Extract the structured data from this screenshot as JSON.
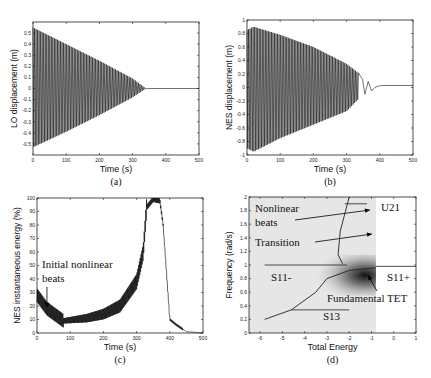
{
  "chart_data": [
    {
      "panel": "a",
      "type": "line",
      "caption": "(a)",
      "xlabel": "Time (s)",
      "ylabel": "LO displacement (m)",
      "xlim": [
        0,
        500
      ],
      "ylim": [
        -0.6,
        0.6
      ],
      "xticks": [
        "0",
        "100",
        "200",
        "300",
        "400",
        "500"
      ],
      "yticks": [
        "-0.5",
        "-0.4",
        "-0.3",
        "-0.2",
        "-0.1",
        "0",
        "0.1",
        "0.2",
        "0.3",
        "0.4",
        "0.5"
      ],
      "description": "Decaying oscillation, envelope ~0.55 at t=0 decreasing linearly to ~0 at t≈340 s, flat at 0 afterwards",
      "envelope": {
        "x": [
          0,
          100,
          200,
          300,
          340,
          500
        ],
        "upper": [
          0.55,
          0.4,
          0.25,
          0.09,
          0.0,
          0.0
        ],
        "lower": [
          -0.53,
          -0.39,
          -0.24,
          -0.08,
          0.0,
          0.0
        ]
      }
    },
    {
      "panel": "b",
      "type": "line",
      "caption": "(b)",
      "xlabel": "Time (s)",
      "ylabel": "NES displacement (m)",
      "xlim": [
        0,
        500
      ],
      "ylim": [
        -1,
        1
      ],
      "xticks": [
        "0",
        "100",
        "200",
        "300",
        "400",
        "500"
      ],
      "yticks": [
        "-1",
        "-0.8",
        "-0.6",
        "-0.4",
        "-0.2",
        "0",
        "0.2",
        "0.4",
        "0.6",
        "0.8",
        "1"
      ],
      "description": "Oscillation with envelope ~0.9 near t=20 s decaying to ~0.2 at t≈340 s, a few slow swings to ~400 s, then settles near 0.02",
      "envelope": {
        "x": [
          0,
          20,
          100,
          200,
          300,
          340,
          380,
          400,
          500
        ],
        "upper": [
          0.85,
          0.9,
          0.78,
          0.6,
          0.35,
          0.2,
          0.08,
          0.03,
          0.03
        ],
        "lower": [
          -0.9,
          -0.95,
          -0.75,
          -0.55,
          -0.35,
          -0.15,
          -0.05,
          0.02,
          0.03
        ]
      }
    },
    {
      "panel": "c",
      "type": "line",
      "caption": "(c)",
      "xlabel": "Time (s)",
      "ylabel": "NES instantaneous energy (%)",
      "xlim": [
        0,
        500
      ],
      "ylim": [
        0,
        100
      ],
      "xticks": [
        "0",
        "100",
        "200",
        "300",
        "400",
        "500"
      ],
      "yticks": [
        "0",
        "10",
        "20",
        "30",
        "40",
        "50",
        "60",
        "70",
        "80",
        "90",
        "100"
      ],
      "annotations": [
        {
          "text": "Initial nonlinear beats",
          "arrow_to": [
            30,
            18
          ]
        }
      ],
      "series": [
        {
          "name": "NES energy",
          "x": [
            0,
            30,
            80,
            150,
            200,
            250,
            300,
            320,
            330,
            350,
            370,
            380,
            400,
            420,
            450,
            500
          ],
          "values": [
            28,
            18,
            9,
            11,
            14,
            20,
            38,
            60,
            93,
            99,
            98,
            80,
            10,
            6,
            1,
            0
          ]
        }
      ]
    },
    {
      "panel": "d",
      "type": "heatmap",
      "caption": "(d)",
      "xlabel": "Total Energy",
      "ylabel": "Frequency (rad/s)",
      "xlim": [
        -6.5,
        1
      ],
      "ylim": [
        0,
        2
      ],
      "xticks": [
        "-6",
        "-5",
        "-4",
        "-3",
        "-2",
        "-1",
        "0",
        "1"
      ],
      "yticks": [
        "0",
        "0.2",
        "0.4",
        "0.6",
        "0.8",
        "1",
        "1.2",
        "1.4",
        "1.6",
        "1.8",
        "2"
      ],
      "annotations": [
        {
          "text": "Nonlinear beats"
        },
        {
          "text": "Transition"
        },
        {
          "text": "U21"
        },
        {
          "text": "S11-"
        },
        {
          "text": "S11+"
        },
        {
          "text": "Fundamental TET"
        },
        {
          "text": "S13"
        }
      ],
      "backbone_lines": {
        "S11_minus": {
          "x": [
            -5.8,
            -2.1
          ],
          "y": [
            1.0,
            1.0
          ]
        },
        "S11_plus": {
          "x": [
            -0.8,
            1.0
          ],
          "y": [
            0.98,
            0.98
          ]
        },
        "S13": {
          "x": [
            -4.6,
            -2.0
          ],
          "y": [
            0.34,
            0.34
          ]
        },
        "U21": {
          "x": [
            -2.2,
            -1.2
          ],
          "y": [
            1.9,
            1.9
          ]
        },
        "lower_branch": {
          "x": [
            -5.8,
            -4.6,
            -3.5,
            -3.0,
            -2.0,
            -0.8
          ],
          "y": [
            0.2,
            0.34,
            0.6,
            0.8,
            0.92,
            0.96
          ]
        },
        "upper_branch": {
          "x": [
            -2.3,
            -2.5,
            -2.4,
            -2.0
          ],
          "y": [
            1.02,
            1.15,
            1.5,
            2.0
          ]
        }
      }
    }
  ]
}
